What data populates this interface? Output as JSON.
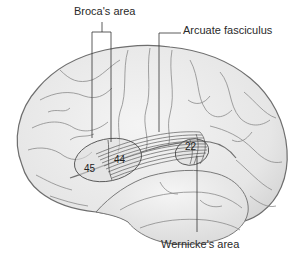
{
  "figure": {
    "labels": {
      "broca": "Broca's area",
      "arcuate": "Arcuate fasciculus",
      "wernicke": "Wernicke's area"
    },
    "brodmann_areas": {
      "area_45": "45",
      "area_44": "44",
      "area_22": "22"
    },
    "colors": {
      "brain_fill": "#e9e9e9",
      "sulcus_stroke": "#8a8a8a",
      "outline_stroke": "#6e6e6e",
      "leader_line": "#333333",
      "background": "#ffffff"
    }
  }
}
